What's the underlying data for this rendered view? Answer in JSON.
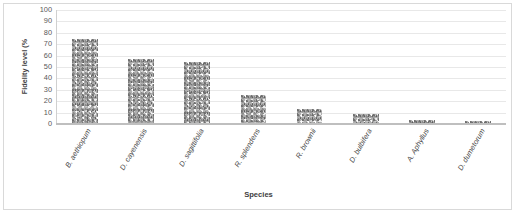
{
  "chart_data": {
    "type": "bar",
    "title": "",
    "xlabel": "Species",
    "ylabel": "Fidelity level (%",
    "ylim": [
      0,
      100
    ],
    "ytick_labels": [
      "100",
      "90",
      "80",
      "70",
      "60",
      "50",
      "40",
      "30",
      "20",
      "10",
      "0"
    ],
    "yticks": [
      100,
      90,
      80,
      70,
      60,
      50,
      40,
      30,
      20,
      10,
      0
    ],
    "grid": true,
    "legend": "none",
    "categories": [
      "B. aethiopum",
      "D. cayenensis",
      "D. sagittifolia",
      "R. splendens",
      "R. brownii",
      "D. bulbifera",
      "A. Aphyllus",
      "D. dumetorum"
    ],
    "values": [
      74,
      57,
      54,
      25,
      12,
      8,
      3,
      2
    ],
    "series_name": "Fidelity level",
    "bar_fill": "#b0b0b0",
    "bar_pattern": "noise-texture-gray",
    "gridline_color": "#e8e8e8",
    "axis_color": "#bfbfbf",
    "frame_color": "#d9d9d9",
    "text_color": "#404040"
  }
}
